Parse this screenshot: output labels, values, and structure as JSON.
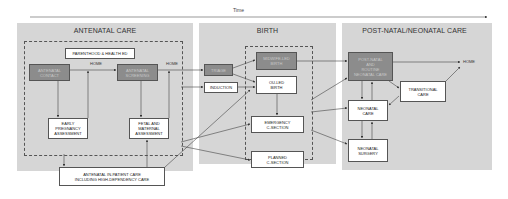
{
  "timeline": {
    "label": "Time"
  },
  "panels": {
    "antenatal": {
      "title": "ANTENATAL CARE",
      "parenthood": "PARENTHOOD & HEALTH ED",
      "contact": "ANTENATAL\nCONTACT",
      "screening": "ANTENATAL\nSCREENING",
      "home1": "HOME",
      "home2": "HOME",
      "early": "EARLY\nPREGNANCY\nASSESSMENT",
      "fetal": "FETAL AND\nMATERNAL\nASSESSMENT",
      "inpatient": "ANTENATAL IN-PATIENT CARE\nINCLUDING HIGH-DEPENDENCY CARE"
    },
    "birth": {
      "title": "BIRTH",
      "triage": "TRIAGE",
      "induction": "INDUCTION",
      "mlu": "MIDWIFE-LED\nBIRTH",
      "olu": "OU-LED\nBIRTH",
      "emergency": "EMERGENCY\nC-SECTION",
      "planned": "PLANNED\nC-SECTION"
    },
    "postnatal": {
      "title": "POST-NATAL/NEONATAL CARE",
      "routine": "POST-NATAL\nAND\nROUTINE\nNEONATAL CARE",
      "home": "HOME",
      "transitional": "TRANSITIONAL\nCARE",
      "neonatal": "NEONATAL\nCARE",
      "surgery": "NEONATAL\nSURGERY"
    }
  },
  "colors": {
    "panel": "#d6d6d6",
    "dark_box": "#8c8c8c",
    "white_box": "#ffffff",
    "line": "#444444"
  }
}
